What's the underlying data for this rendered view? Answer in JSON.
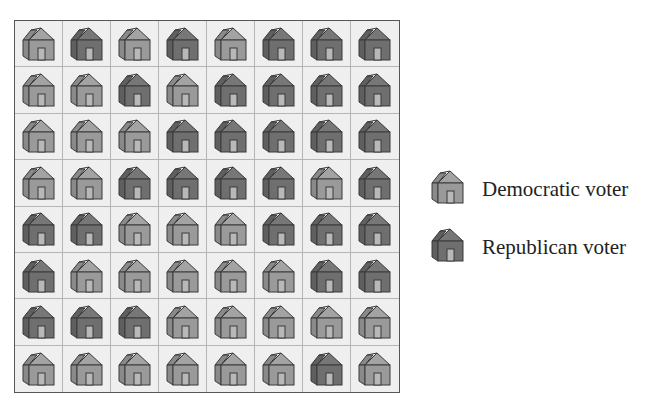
{
  "chart_data": {
    "type": "table",
    "title": "",
    "rows": 8,
    "columns": 8,
    "legend": [
      {
        "key": "D",
        "label": "Democratic voter",
        "color": "#9a9a9a"
      },
      {
        "key": "R",
        "label": "Republican voter",
        "color": "#6f6f6f"
      }
    ],
    "grid": [
      [
        "D",
        "R",
        "D",
        "R",
        "D",
        "R",
        "R",
        "R"
      ],
      [
        "D",
        "D",
        "R",
        "D",
        "R",
        "R",
        "R",
        "R"
      ],
      [
        "D",
        "D",
        "D",
        "R",
        "R",
        "R",
        "R",
        "R"
      ],
      [
        "D",
        "D",
        "R",
        "R",
        "R",
        "R",
        "D",
        "R"
      ],
      [
        "R",
        "R",
        "D",
        "D",
        "D",
        "R",
        "R",
        "R"
      ],
      [
        "R",
        "D",
        "D",
        "D",
        "D",
        "D",
        "R",
        "R"
      ],
      [
        "R",
        "R",
        "R",
        "D",
        "D",
        "D",
        "D",
        "D"
      ],
      [
        "D",
        "D",
        "D",
        "D",
        "D",
        "D",
        "R",
        "D"
      ]
    ],
    "totals": {
      "Democratic voter": 32,
      "Republican voter": 32
    }
  },
  "legend": {
    "democratic": {
      "label": "Democratic voter",
      "icon": "house-icon-light"
    },
    "republican": {
      "label": "Republican voter",
      "icon": "house-icon-dark"
    }
  },
  "colors": {
    "dem_front": "#9a9a9a",
    "dem_roof": "#a3a3a3",
    "dem_side": "#8a8a8a",
    "rep_front": "#6f6f6f",
    "rep_roof": "#777777",
    "rep_side": "#5f5f5f",
    "door": "#b8b8b8",
    "outline": "#3a3a3a"
  }
}
